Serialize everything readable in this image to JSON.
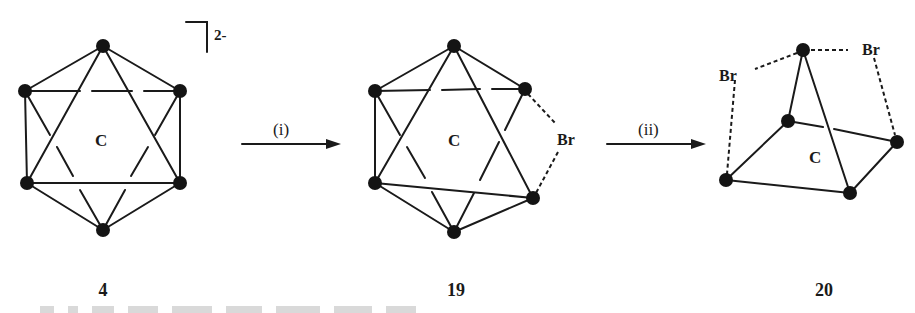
{
  "scheme": {
    "compounds": [
      {
        "id": "4",
        "label": "4",
        "center_atom": "C",
        "charge": "2-",
        "geometry": "icosahedral cage (12-vertex closo carborane dianion)"
      },
      {
        "id": "19",
        "label": "19",
        "center_atom": "C",
        "bridge_atom": "Br",
        "geometry": "icosahedral cage with one bromine bridge"
      },
      {
        "id": "20",
        "label": "20",
        "center_atom": "C",
        "bridge_atoms": [
          "Br",
          "Br"
        ],
        "geometry": "open pyramidal cage with two bromine bridges"
      }
    ],
    "arrows": [
      {
        "label": "(i)",
        "from": "4",
        "to": "19"
      },
      {
        "label": "(ii)",
        "from": "19",
        "to": "20"
      }
    ],
    "caption_visible": false
  },
  "labels": {
    "c4": "C",
    "charge4": "2-",
    "c19": "C",
    "br19": "Br",
    "c20": "C",
    "br20_left": "Br",
    "br20_right": "Br",
    "arrow1": "(i)",
    "arrow2": "(ii)",
    "cmp4": "4",
    "cmp19": "19",
    "cmp20": "20"
  }
}
